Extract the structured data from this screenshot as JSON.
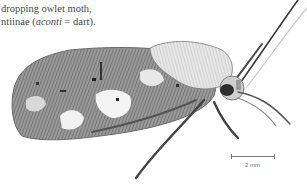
{
  "caption": {
    "line1": "dropping owlet moth,",
    "line2_prefix": "ntiinae (",
    "line2_italic": "aconti",
    "line2_suffix": " = dart)."
  },
  "figure": {
    "style": "grayscale pen-and-ink"
  },
  "scale_bar": {
    "label": "2 mm"
  },
  "colors": {
    "background": "#ffffff",
    "ink_dark": "#2a2a2a",
    "ink_mid": "#7a7a7a",
    "ink_light": "#bdbdbd",
    "text": "#4a4a4a"
  }
}
